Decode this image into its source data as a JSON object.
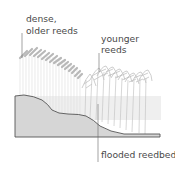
{
  "diagram": {
    "labels": {
      "older_line1": "dense,",
      "older_line2": "older reeds",
      "younger_line1": "younger",
      "younger_line2": "reeds",
      "flooded": "flooded reedbed"
    },
    "colors": {
      "ground_fill": "#d6d6d6",
      "ground_stroke": "#555555",
      "water": "#efefef",
      "older_reeds": "#b8b8b8",
      "younger_reeds": "#c8c8c8",
      "leader": "#666666",
      "text": "#4a4a4a"
    }
  }
}
